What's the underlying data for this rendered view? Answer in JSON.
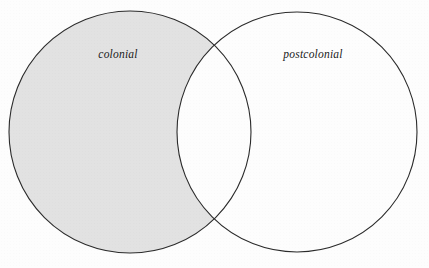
{
  "figure": {
    "background_color": "#fdfdfd"
  },
  "labels": {
    "left": "colonial",
    "right": "postcolonial"
  },
  "chart_data": {
    "type": "diagram",
    "diagram_type": "venn2",
    "title": "",
    "sets": [
      {
        "id": "left",
        "label": "colonial",
        "center_x": 130,
        "center_y": 132,
        "radius": 121,
        "fill": "#e2e2e2",
        "stroke": "#2b2b2b"
      },
      {
        "id": "right",
        "label": "postcolonial",
        "center_x": 297,
        "center_y": 132,
        "radius": 120,
        "fill": "#ffffff",
        "stroke": "#2b2b2b"
      }
    ],
    "regions": [
      {
        "id": "left-only",
        "description": "colonial only",
        "shaded": true,
        "fill": "#e2e2e2"
      },
      {
        "id": "intersection",
        "description": "colonial and postcolonial",
        "shaded": false,
        "fill": "#ffffff"
      },
      {
        "id": "right-only",
        "description": "postcolonial only",
        "shaded": false,
        "fill": "#ffffff"
      }
    ],
    "highlighted_region": "left-only",
    "intersection_points": [
      {
        "x": 216,
        "y": 44
      },
      {
        "x": 216,
        "y": 222
      }
    ],
    "stroke_width": 1,
    "legend": null,
    "grid": false
  },
  "colors": {
    "shade": "#e2e2e2",
    "outline": "#2b2b2b",
    "text": "#1b1b1b",
    "background": "#fdfdfd"
  }
}
